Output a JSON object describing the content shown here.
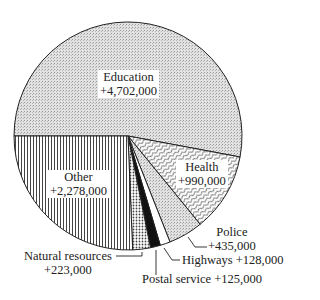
{
  "chart_data": {
    "type": "pie",
    "title": "",
    "start_angle_deg": 180,
    "direction": "clockwise",
    "slices": [
      {
        "label": "Education",
        "value": 4702000,
        "display": "+4,702,000",
        "pattern": "stipple-light"
      },
      {
        "label": "Health",
        "value": 990000,
        "display": "+990,000",
        "pattern": "wavy"
      },
      {
        "label": "Police",
        "value": 435000,
        "display": "+435,000",
        "pattern": "stipple-light"
      },
      {
        "label": "Highways",
        "value": 128000,
        "display": "+128,000",
        "pattern": "white"
      },
      {
        "label": "Postal service",
        "value": 125000,
        "display": "+125,000",
        "pattern": "black"
      },
      {
        "label": "Natural resources",
        "value": 223000,
        "display": "+223,000",
        "pattern": "dots"
      },
      {
        "label": "Other",
        "value": 2278000,
        "display": "+2,278,000",
        "pattern": "vertical-lines"
      }
    ]
  },
  "labels": {
    "education": {
      "name": "Education",
      "value": "+4,702,000"
    },
    "health": {
      "name": "Health",
      "value": "+990,000"
    },
    "police": {
      "name": "Police",
      "value": "+435,000"
    },
    "highways": {
      "text": "Highways  +128,000"
    },
    "postal": {
      "text": "Postal service  +125,000"
    },
    "natural": {
      "name": "Natural resources",
      "value": "+223,000"
    },
    "other": {
      "name": "Other",
      "value": "+2,278,000"
    }
  }
}
